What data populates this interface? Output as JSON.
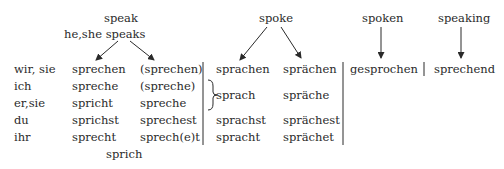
{
  "headers": {
    "speak": "speak",
    "he_she_speaks": "he,she speaks",
    "spoke": "spoke",
    "spoken": "spoken",
    "speaking": "speaking"
  },
  "pronouns": [
    "wir, sie",
    "ich",
    "er,sie",
    "du",
    "ihr"
  ],
  "present_indicative": [
    "sprechen",
    "spreche",
    "spricht",
    "sprichst",
    "sprecht"
  ],
  "present_subjunctive": [
    "(sprechen)",
    "(spreche)",
    "spreche",
    "sprechest",
    "sprech(e)t"
  ],
  "imperative": "sprich",
  "past_indicative": [
    "sprachen",
    "sprach",
    "sprachst",
    "spracht"
  ],
  "past_subjunctive": [
    "sprächen",
    "spräche",
    "sprächest",
    "sprächet"
  ],
  "past_participle": "gesprochen",
  "present_participle": "sprechend"
}
